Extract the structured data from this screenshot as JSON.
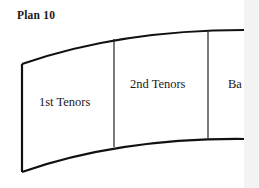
{
  "title": "Plan 10",
  "sections": [
    {
      "label": "1st Tenors"
    },
    {
      "label": "2nd Tenors"
    },
    {
      "label": "Ba"
    }
  ]
}
